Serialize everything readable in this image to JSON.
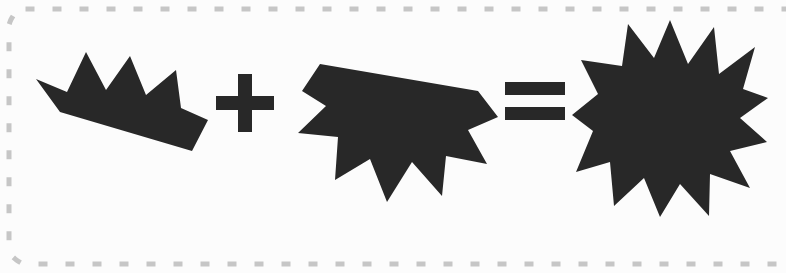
{
  "panel": {
    "name": "shape-equation-panel",
    "background_color": "#fcfcfc",
    "border_style": "dotted",
    "border_color": "#c8c8c8",
    "border_radius": "28",
    "caption": "Shape addition equation"
  },
  "equation": {
    "expression": "crown + lower-star = star",
    "shape_color": "#282828",
    "terms": [
      {
        "role": "operand",
        "index": 0,
        "name": "crown-shape",
        "label": "Crown",
        "description": "Upper portion of a star: four upward spikes on a slanted base"
      },
      {
        "role": "operator",
        "index": 1,
        "name": "plus-operator",
        "label": "+",
        "description": "Plus sign"
      },
      {
        "role": "operand",
        "index": 2,
        "name": "lower-star-shape",
        "label": "Lower star",
        "description": "Lower portion of a star: flat slanted top with downward spikes"
      },
      {
        "role": "operator",
        "index": 3,
        "name": "equals-operator",
        "label": "=",
        "description": "Equals sign"
      },
      {
        "role": "result",
        "index": 4,
        "name": "star-shape",
        "label": "Star",
        "points": 13,
        "description": "Complete 13-pointed star"
      }
    ]
  }
}
